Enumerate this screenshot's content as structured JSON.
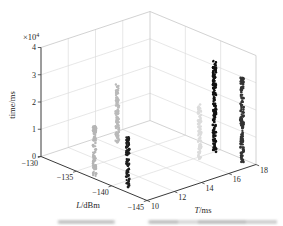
{
  "figure": {
    "background": "#ffffff",
    "title": ""
  },
  "colors": {
    "grid": "#dcdcdc",
    "wall_edge": "#c6c6c6",
    "axis": "#3a3a3a",
    "text": "#1f1f1f"
  },
  "chart_data": {
    "type": "scatter",
    "projection": "3d-column-scatter",
    "title": "",
    "grid": true,
    "axes": {
      "x": {
        "label": "L/dBm",
        "label_var": "L",
        "label_unit": "/dBm",
        "range": [
          -145,
          -130
        ],
        "ticks": [
          -130,
          -135,
          -140,
          -145
        ],
        "tick_labels": [
          "−130",
          "−135",
          "−140",
          "−145"
        ]
      },
      "y": {
        "label": "T/ms",
        "label_var": "T",
        "label_unit": "/ms",
        "range": [
          10,
          18
        ],
        "ticks": [
          10,
          12,
          14,
          16,
          18
        ],
        "tick_labels": [
          "10",
          "12",
          "14",
          "16",
          "18"
        ]
      },
      "z": {
        "label": "time/ms",
        "multiplier": "×10",
        "exponent": "4",
        "range": [
          0,
          40000
        ],
        "ticks": [
          0,
          10000,
          20000,
          30000,
          40000
        ],
        "tick_labels": [
          "0",
          "1",
          "2",
          "3",
          "4"
        ]
      }
    },
    "series": [
      {
        "name": "column-1",
        "L": -137.0,
        "T": 10.3,
        "z_min": 0,
        "z_max": 18500,
        "color": "#b5b5b5"
      },
      {
        "name": "column-2",
        "L": -132.5,
        "T": 14.3,
        "z_min": 0,
        "z_max": 23000,
        "color": "#bababa"
      },
      {
        "name": "column-3",
        "L": -141.3,
        "T": 10.5,
        "z_min": 0,
        "z_max": 18500,
        "color": "#1e1e1e"
      },
      {
        "name": "column-4",
        "L": -140.5,
        "T": 16.2,
        "z_min": 0,
        "z_max": 20000,
        "color": "#dcdcdc"
      },
      {
        "name": "column-5",
        "L": -139.9,
        "T": 17.6,
        "z_min": 0,
        "z_max": 33000,
        "color": "#121212"
      },
      {
        "name": "column-6",
        "L": -143.6,
        "T": 17.7,
        "z_min": 0,
        "z_max": 31000,
        "color": "#333333"
      }
    ]
  }
}
